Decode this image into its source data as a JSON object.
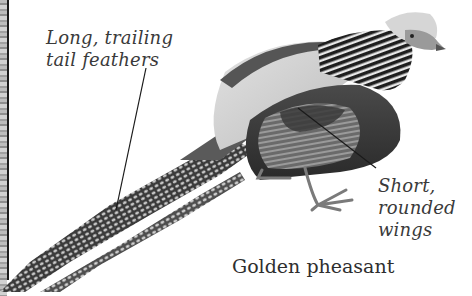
{
  "image": {
    "subject": "Golden pheasant illustration",
    "caption": "Golden pheasant",
    "annotations": [
      {
        "id": "tail",
        "lines": [
          "Long, trailing",
          "tail feathers"
        ]
      },
      {
        "id": "wings",
        "lines": [
          "Short,",
          "rounded",
          "wings"
        ]
      }
    ]
  },
  "colors": {
    "background": "#ffffff",
    "text": "#333333",
    "leader_line": "#1a1a1a"
  }
}
